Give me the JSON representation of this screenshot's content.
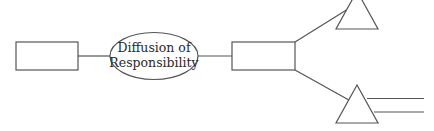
{
  "diagram": {
    "nodes": [
      {
        "id": "left-box",
        "shape": "rectangle",
        "label": ""
      },
      {
        "id": "center-ellipse",
        "shape": "ellipse",
        "label_lines": [
          "Diffusion of",
          "Responsibility"
        ]
      },
      {
        "id": "middle-box",
        "shape": "rectangle",
        "label": ""
      },
      {
        "id": "upper-triangle",
        "shape": "triangle",
        "label": ""
      },
      {
        "id": "lower-triangle",
        "shape": "triangle",
        "label": ""
      }
    ],
    "edges": [
      {
        "from": "left-box",
        "to": "center-ellipse"
      },
      {
        "from": "center-ellipse",
        "to": "middle-box"
      },
      {
        "from": "middle-box",
        "to": "upper-triangle"
      },
      {
        "from": "middle-box",
        "to": "lower-triangle"
      }
    ],
    "extra_lines": [
      {
        "from": "lower-triangle",
        "description": "double horizontal line extending right"
      }
    ],
    "colors": {
      "stroke": "#555555",
      "text": "#2a2a2a",
      "background": "#ffffff"
    }
  }
}
